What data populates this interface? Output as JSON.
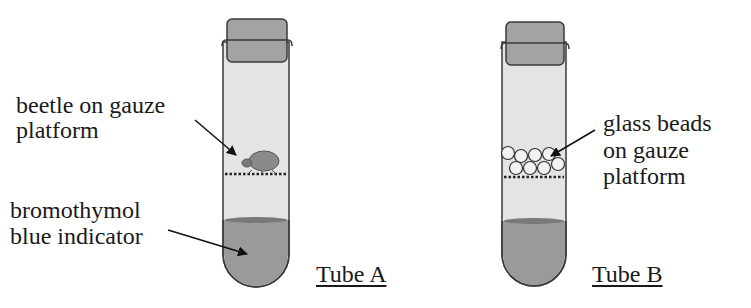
{
  "diagram": {
    "colors": {
      "tube_glass": "#e4e4e4",
      "tube_outline": "#3a3a3a",
      "cap": "#a3a3a3",
      "indicator_liquid": "#9a9a9a",
      "liquid_surface": "#7a7a7a",
      "beetle": "#8a8a8a",
      "bead_fill": "#f2f2f2",
      "text": "#1a1a1a"
    },
    "tube_a": {
      "caption": "Tube A",
      "labels": {
        "beetle_line1": "beetle on gauze",
        "beetle_line2": "platform",
        "indicator_line1": "bromothymol",
        "indicator_line2": "blue indicator"
      }
    },
    "tube_b": {
      "caption": "Tube B",
      "labels": {
        "beads_line1": "glass beads",
        "beads_line2": "on gauze",
        "beads_line3": "platform"
      }
    }
  }
}
